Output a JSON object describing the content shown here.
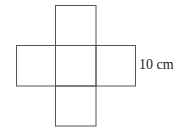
{
  "diagram": {
    "type": "cube-net-cross",
    "squares": [
      {
        "id": "top",
        "x": 55.5,
        "y": 5.5,
        "w": 40.5,
        "h": 40
      },
      {
        "id": "left",
        "x": 16.5,
        "y": 45.5,
        "w": 39,
        "h": 40.5
      },
      {
        "id": "center",
        "x": 55.5,
        "y": 45.5,
        "w": 40.5,
        "h": 40.5
      },
      {
        "id": "right",
        "x": 96,
        "y": 45.5,
        "w": 39.5,
        "h": 40.5
      },
      {
        "id": "bottom",
        "x": 55.5,
        "y": 86,
        "w": 40.5,
        "h": 40
      }
    ],
    "stroke_color": "#555555",
    "dimension_label": "10 cm"
  }
}
